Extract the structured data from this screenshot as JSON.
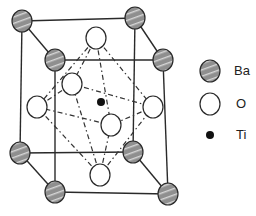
{
  "diagram": {
    "type": "crystal-structure",
    "structure": "perovskite unit cell",
    "colors": {
      "ba_fill": "#8f8f8f",
      "ba_stripe": "#d0d0d0",
      "outline": "#2a2a2a",
      "o_fill": "#ffffff",
      "ti_fill": "#111111"
    }
  },
  "legend": {
    "items": [
      {
        "symbol": "Ba",
        "label": "Ba"
      },
      {
        "symbol": "O",
        "label": "O"
      },
      {
        "symbol": "Ti",
        "label": "Ti"
      }
    ]
  }
}
